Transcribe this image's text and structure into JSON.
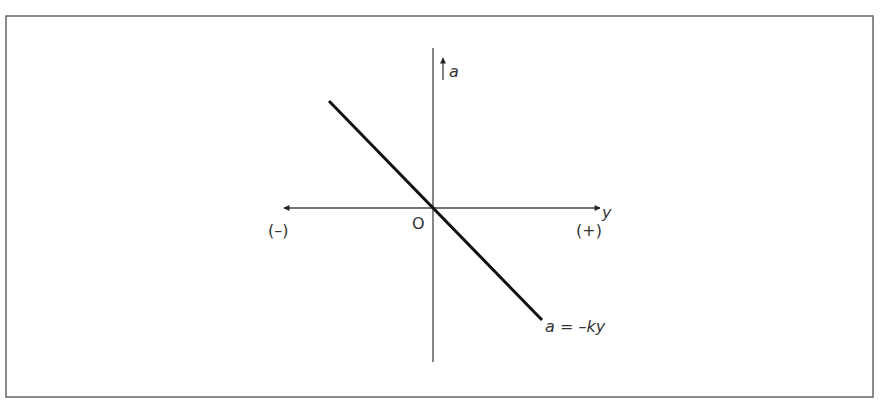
{
  "diagram": {
    "vertical_axis_label": "a",
    "horizontal_axis_label": "y",
    "origin_label": "O",
    "negative_label": "(–)",
    "positive_label": "(+)",
    "line_label": "a = –ky",
    "line_slope_sign": "negative"
  }
}
